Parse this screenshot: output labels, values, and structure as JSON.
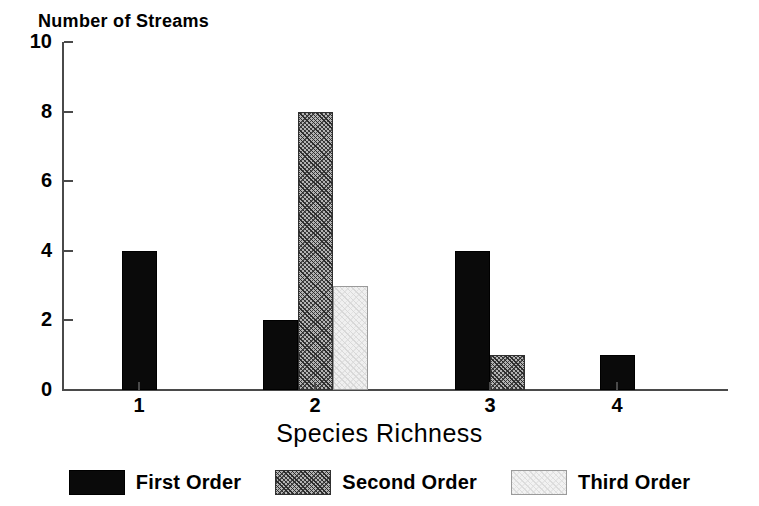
{
  "chart_data": {
    "type": "bar",
    "title": "",
    "xlabel": "Species Richness",
    "ylabel": "Number of Streams",
    "categories": [
      "1",
      "2",
      "3",
      "4"
    ],
    "series": [
      {
        "name": "First Order",
        "values": [
          4,
          2,
          4,
          1
        ],
        "fill": "solid-black",
        "color": "#0a0a0a"
      },
      {
        "name": "Second Order",
        "values": [
          0,
          8,
          1,
          0
        ],
        "fill": "diagonal-hatch",
        "color": "#b4b4b4"
      },
      {
        "name": "Third Order",
        "values": [
          0,
          3,
          0,
          0
        ],
        "fill": "light-stipple",
        "color": "#f0f0f0"
      }
    ],
    "ylim": [
      0,
      10
    ],
    "yticks": [
      0,
      2,
      4,
      6,
      8,
      10
    ],
    "ytick_labels": [
      "0",
      "2",
      "4",
      "6",
      "8",
      "10"
    ],
    "xticks": [
      1,
      2,
      3,
      4
    ],
    "xtick_labels": [
      "1",
      "2",
      "3",
      "4"
    ],
    "grid": false,
    "legend_position": "bottom-center",
    "axis_color": "#4a4a4a"
  },
  "axes": {
    "y_title": "Number of Streams",
    "x_title": "Species Richness"
  },
  "legend": {
    "items": [
      {
        "label": "First Order"
      },
      {
        "label": "Second Order"
      },
      {
        "label": "Third Order"
      }
    ]
  }
}
